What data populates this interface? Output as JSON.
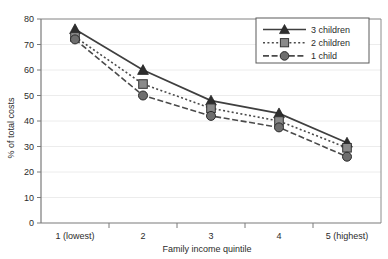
{
  "chart_data": {
    "type": "line",
    "title": "",
    "xlabel": "Family income quintile",
    "ylabel": "% of total costs",
    "categories": [
      "1 (lowest)",
      "2",
      "3",
      "4",
      "5 (highest)"
    ],
    "xtick_labels": [
      "1 (lowest)",
      "2",
      "3",
      "4",
      "5 (highest)"
    ],
    "ytick_labels": [
      "0",
      "10",
      "20",
      "30",
      "40",
      "50",
      "60",
      "70",
      "80"
    ],
    "ylim": [
      0,
      80
    ],
    "ytick_step": 10,
    "grid": "horizontal",
    "legend_position": "top-right",
    "series": [
      {
        "name": "3 children",
        "values": [
          76,
          60,
          48,
          43,
          31.5
        ],
        "line_style": "solid",
        "marker": "triangle",
        "color": "#3f3f3f"
      },
      {
        "name": "2 children",
        "values": [
          73,
          54.5,
          45,
          40,
          29.5
        ],
        "line_style": "dotted",
        "marker": "square",
        "color": "#4a4a4a"
      },
      {
        "name": "1 child",
        "values": [
          72,
          50,
          42,
          37.5,
          26
        ],
        "line_style": "dashed",
        "marker": "circle",
        "color": "#4a4a4a"
      }
    ]
  },
  "legend": {
    "entries": [
      {
        "label": "3 children"
      },
      {
        "label": "2 children"
      },
      {
        "label": "1 child"
      }
    ]
  },
  "axes": {
    "y_title": "% of total costs",
    "x_title": "Family income quintile"
  }
}
